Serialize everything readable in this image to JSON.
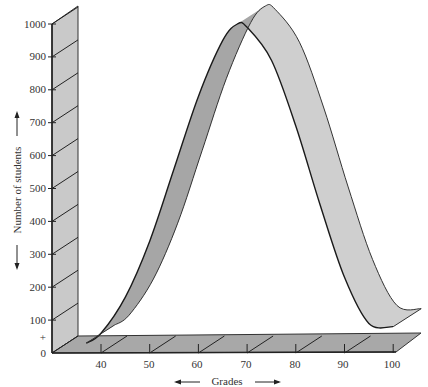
{
  "chart_data": {
    "type": "area",
    "style": "3d-ribbon",
    "title": "",
    "xlabel": "Grades",
    "ylabel": "Number of students",
    "x_ticks": [
      40,
      50,
      60,
      70,
      80,
      90,
      100
    ],
    "y_ticks": [
      0,
      100,
      200,
      300,
      400,
      500,
      600,
      700,
      800,
      900,
      1000
    ],
    "y_extra_mark": "+",
    "xlim": [
      35,
      100
    ],
    "ylim": [
      0,
      1000
    ],
    "grid": false,
    "legend": null,
    "series": [
      {
        "name": "Grade distribution",
        "x": [
          37,
          40,
          45,
          50,
          55,
          60,
          65,
          68,
          70,
          75,
          80,
          85,
          90,
          95,
          100
        ],
        "values": [
          30,
          60,
          170,
          340,
          560,
          780,
          950,
          1000,
          990,
          890,
          690,
          450,
          230,
          90,
          80
        ]
      }
    ]
  },
  "labels": {
    "y_axis_title": "Number of students",
    "x_axis_title": "Grades",
    "y_ticks": [
      "0",
      "+",
      "100",
      "200",
      "300",
      "400",
      "500",
      "600",
      "700",
      "800",
      "900",
      "1000"
    ],
    "x_ticks": [
      "40",
      "50",
      "60",
      "70",
      "80",
      "90",
      "100"
    ]
  },
  "colors": {
    "wall": "#c8c8c8",
    "floor": "#a9a9a9",
    "ribbon_top": "#cfcfcf",
    "ribbon_underside": "#a6a6a6",
    "line": "#222222"
  }
}
